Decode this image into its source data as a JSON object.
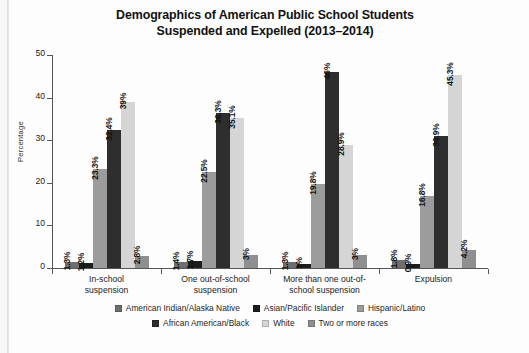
{
  "chart_data": {
    "type": "bar",
    "title": "Demographics of American Public School Students Suspended and Expelled (2013–2014)",
    "title_line1": "Demographics of American Public School Students",
    "title_line2": "Suspended and Expelled (2013–2014)",
    "xlabel": "",
    "ylabel": "Percentage",
    "ylim": [
      0,
      50
    ],
    "yticks": [
      0,
      10,
      20,
      30,
      40,
      50
    ],
    "ytick_labels": [
      "0",
      "10",
      "20",
      "30",
      "40",
      "50"
    ],
    "grid": false,
    "legend_position": "bottom",
    "categories": [
      "In-school suspension",
      "One out-of-school suspension",
      "More than one out-of-school suspension",
      "Expulsion"
    ],
    "category_lines": [
      [
        "In-school",
        "suspension"
      ],
      [
        "One out-of-school",
        "suspension"
      ],
      [
        "More than one out-of-",
        "school suspension"
      ],
      [
        "Expulsion"
      ]
    ],
    "series": [
      {
        "name": "American Indian/Alaska Native",
        "color": "#6e6e6e",
        "values": [
          1.3,
          1.4,
          1.3,
          1.8
        ],
        "labels": [
          "1.3%",
          "1.4%",
          "1.3%",
          "1.8%"
        ]
      },
      {
        "name": "Asian/Pacific Islander",
        "color": "#1c1c1c",
        "values": [
          1.2,
          1.7,
          1.0,
          0.9
        ],
        "labels": [
          "1.2%",
          "1.7%",
          "1%",
          "0.9%"
        ]
      },
      {
        "name": "Hispanic/Latino",
        "color": "#9c9c9c",
        "values": [
          23.3,
          22.5,
          19.8,
          16.8
        ],
        "labels": [
          "23.3%",
          "22.5%",
          "19.8%",
          "16.8%"
        ]
      },
      {
        "name": "African American/Black",
        "color": "#2e2e2e",
        "values": [
          32.4,
          36.3,
          46.0,
          30.9
        ],
        "labels": [
          "32.4%",
          "36.3%",
          "46%",
          "30.9%"
        ]
      },
      {
        "name": "White",
        "color": "#d5d5d5",
        "values": [
          39.0,
          35.1,
          28.9,
          45.3
        ],
        "labels": [
          "39%",
          "35.1%",
          "28.9%",
          "45.3%"
        ]
      },
      {
        "name": "Two or more races",
        "color": "#8f8f8f",
        "values": [
          2.8,
          3.0,
          3.0,
          4.2
        ],
        "labels": [
          "2.8%",
          "3%",
          "3%",
          "4.2%"
        ]
      }
    ],
    "legend_rows": [
      [
        "American Indian/Alaska Native",
        "Asian/Pacific Islander",
        "Hispanic/Latino"
      ],
      [
        "African American/Black",
        "White",
        "Two or more races"
      ]
    ]
  }
}
